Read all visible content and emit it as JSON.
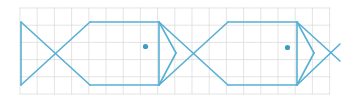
{
  "canvas": {
    "width": 344,
    "height": 102,
    "background_color": "#ffffff",
    "title": "Tessellated fish pattern on grid"
  },
  "grid": {
    "name": "graph-paper-grid",
    "line_color": "#d9d9d9",
    "line_width": 0.7,
    "cell_size": 17.2,
    "x_start": 20,
    "x_end": 330,
    "y_start": 8,
    "y_end": 94,
    "columns": 18,
    "rows": 5
  },
  "figure": {
    "stroke_color": "#56b0d4",
    "stroke_width": 1.6,
    "eye_color": "#3b9cc4",
    "eye_radius": 2.6,
    "fill": "none"
  },
  "chart_data": {
    "type": "line",
    "xlabel": "",
    "ylabel": "",
    "xlim": [
      20,
      330
    ],
    "ylim": [
      8,
      94
    ],
    "grid": true,
    "legend": "none",
    "shapes": [
      {
        "name": "fish-1-tail",
        "kind": "bowtie",
        "points": [
          [
            21,
            22
          ],
          [
            21,
            85
          ],
          [
            90,
            22
          ],
          [
            90,
            85
          ]
        ],
        "segments": [
          [
            [
              21,
              22
            ],
            [
              21,
              85
            ]
          ],
          [
            [
              21,
              22
            ],
            [
              90,
              85
            ]
          ],
          [
            [
              21,
              85
            ],
            [
              90,
              22
            ]
          ]
        ]
      },
      {
        "name": "fish-1-body",
        "kind": "hexagon",
        "segments": [
          [
            [
              90,
              22
            ],
            [
              159,
              22
            ]
          ],
          [
            [
              159,
              22
            ],
            [
              176,
              53
            ]
          ],
          [
            [
              176,
              53
            ],
            [
              159,
              85
            ]
          ],
          [
            [
              159,
              85
            ],
            [
              90,
              85
            ]
          ]
        ]
      },
      {
        "name": "fish-1-eye",
        "kind": "dot",
        "cx": 145.5,
        "cy": 46.5,
        "r": 2.6
      },
      {
        "name": "fish-2-tail",
        "kind": "bowtie",
        "points": [
          [
            159,
            22
          ],
          [
            159,
            85
          ],
          [
            228,
            22
          ],
          [
            228,
            85
          ]
        ],
        "segments": [
          [
            [
              159,
              22
            ],
            [
              159,
              85
            ]
          ],
          [
            [
              159,
              22
            ],
            [
              228,
              85
            ]
          ],
          [
            [
              159,
              85
            ],
            [
              228,
              22
            ]
          ]
        ]
      },
      {
        "name": "fish-2-body",
        "kind": "hexagon",
        "segments": [
          [
            [
              228,
              22
            ],
            [
              297,
              22
            ]
          ],
          [
            [
              297,
              22
            ],
            [
              314,
              53
            ]
          ],
          [
            [
              314,
              53
            ],
            [
              297,
              85
            ]
          ],
          [
            [
              297,
              85
            ],
            [
              228,
              85
            ]
          ]
        ]
      },
      {
        "name": "fish-2-eye",
        "kind": "dot",
        "cx": 287.5,
        "cy": 47.5,
        "r": 2.6
      },
      {
        "name": "fish-3-tail-partial",
        "kind": "bowtie",
        "points": [
          [
            297,
            22
          ],
          [
            297,
            85
          ],
          [
            344,
            53
          ]
        ],
        "segments": [
          [
            [
              297,
              22
            ],
            [
              297,
              85
            ]
          ],
          [
            [
              297,
              22
            ],
            [
              340,
              61
            ]
          ],
          [
            [
              297,
              85
            ],
            [
              340,
              44
            ]
          ]
        ]
      }
    ]
  }
}
